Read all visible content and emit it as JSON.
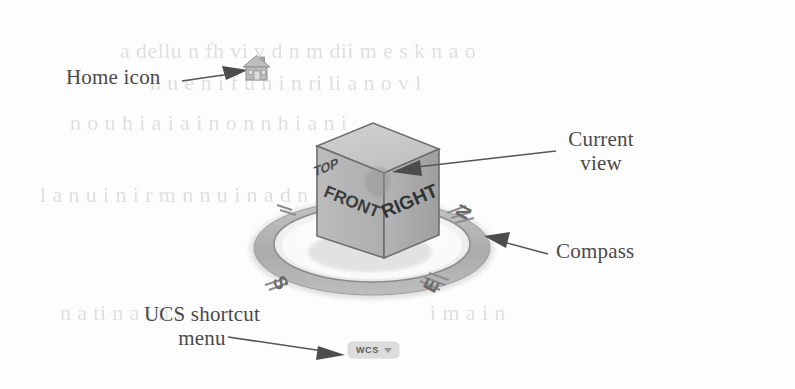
{
  "figure": {
    "background_color": "#fdfdfd"
  },
  "callouts": [
    {
      "key": "home_icon",
      "label": "Home icon",
      "target": "home-icon"
    },
    {
      "key": "current_view",
      "label": "Current\nview",
      "target": "viewcube-front-top-edge"
    },
    {
      "key": "compass",
      "label": "Compass",
      "target": "compass-ring"
    },
    {
      "key": "ucs_menu",
      "label": "UCS shortcut\nmenu",
      "target": "ucs-shortcut-menu"
    }
  ],
  "labels": {
    "home_icon": "Home icon",
    "current_view": "Current\nview",
    "compass": "Compass",
    "ucs_shortcut_menu": "UCS shortcut\nmenu"
  },
  "viewcube": {
    "faces": [
      {
        "name": "top",
        "label": "TOP"
      },
      {
        "name": "front",
        "label": "FRONT"
      },
      {
        "name": "right",
        "label": "RIGHT"
      }
    ],
    "face_colors": {
      "top": "#c9c9c9",
      "front": "#b5b5b5",
      "right": "#a9a9a9",
      "edge": "#6e6e6e",
      "text": "#3d3d3d"
    }
  },
  "compass": {
    "directions": [
      {
        "name": "north",
        "label": "N",
        "position": "upper-right"
      },
      {
        "name": "east",
        "label": "E",
        "position": "lower-right"
      },
      {
        "name": "south",
        "label": "S",
        "position": "lower-left"
      }
    ],
    "ring_color": "#b3b3b3",
    "ring_shadow_color": "#cfcfcf"
  },
  "ucs_menu": {
    "value": "WCS",
    "chevron": "chevron-down-icon",
    "pill_color": "#dcdcdc"
  },
  "home_icon": {
    "name": "home-icon",
    "color": "#b0b0b0"
  },
  "ghost_text": [
    {
      "text": "a dellu n fh  vi v  d  n  m dii m e  s k n a o",
      "x": 120,
      "y": 38,
      "size": 22
    },
    {
      "text": "n u  e n i  f  u n  i n  ri li  a n o v l",
      "x": 150,
      "y": 70,
      "size": 22
    },
    {
      "text": "n o u h  i a i a   i n  o n n h  i a n  i",
      "x": 70,
      "y": 110,
      "size": 22
    },
    {
      "text": "l  a  n u  i n   i r m  n  n u i  n  a d  n  i",
      "x": 40,
      "y": 182,
      "size": 22
    },
    {
      "text": "n a  ti   n a  i  n  i",
      "x": 60,
      "y": 300,
      "size": 22
    },
    {
      "text": "i m  a  i n",
      "x": 430,
      "y": 300,
      "size": 22
    }
  ]
}
